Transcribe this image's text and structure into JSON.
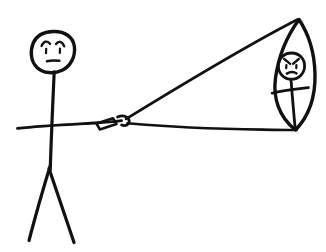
{
  "drawing": {
    "title": "Stick figure flying an angry kite",
    "medium": "black-ink-sketch",
    "background_color": "#ffffff",
    "ink_color": "#111111",
    "canvas": {
      "width": 326,
      "height": 252
    },
    "caption": "",
    "elements": [
      {
        "name": "stick-person",
        "label": "Stick person holding kite string",
        "mood": "sad",
        "parts": [
          {
            "name": "head",
            "shape": "ellipse",
            "cx": 53,
            "cy": 52,
            "rx": 21,
            "ry": 20
          },
          {
            "name": "left-eyebrow",
            "shape": "arc"
          },
          {
            "name": "right-eyebrow",
            "shape": "arc"
          },
          {
            "name": "left-eye",
            "shape": "tick"
          },
          {
            "name": "right-eye",
            "shape": "tick"
          },
          {
            "name": "mouth",
            "shape": "short-line",
            "expression": "flat-frown"
          },
          {
            "name": "torso",
            "shape": "line",
            "x1": 53,
            "y1": 72,
            "x2": 50,
            "y2": 170
          },
          {
            "name": "arms",
            "shape": "line",
            "x1": 18,
            "y1": 128,
            "x2": 120,
            "y2": 122
          },
          {
            "name": "left-leg",
            "shape": "line",
            "x1": 47,
            "y1": 168,
            "x2": 28,
            "y2": 240
          },
          {
            "name": "right-leg",
            "shape": "line",
            "x1": 47,
            "y1": 168,
            "x2": 73,
            "y2": 242
          }
        ]
      },
      {
        "name": "kite-handle",
        "label": "Kite string handle / reel in the hand",
        "parts": [
          {
            "name": "handle-body",
            "shape": "quad"
          },
          {
            "name": "handle-tip",
            "shape": "hook"
          }
        ]
      },
      {
        "name": "kite-string-upper",
        "label": "Upper kite string to kite apex",
        "shape": "line",
        "x1": 128,
        "y1": 120,
        "x2": 299,
        "y2": 20
      },
      {
        "name": "kite-string-lower",
        "label": "Lower kite string to kite tail point",
        "shape": "line",
        "x1": 128,
        "y1": 123,
        "x2": 297,
        "y2": 130
      },
      {
        "name": "kite",
        "label": "Leaf-shaped kite with an angry face",
        "mood": "angry",
        "parts": [
          {
            "name": "kite-outline",
            "shape": "leaf",
            "apex_x": 299,
            "apex_y": 20,
            "tail_x": 297,
            "tail_y": 130
          },
          {
            "name": "kite-face-head",
            "shape": "circle",
            "cx": 291,
            "cy": 66,
            "r": 13
          },
          {
            "name": "kite-left-eyebrow",
            "shape": "slant"
          },
          {
            "name": "kite-right-eyebrow",
            "shape": "slant"
          },
          {
            "name": "kite-left-eye",
            "shape": "dot"
          },
          {
            "name": "kite-right-eye",
            "shape": "dot"
          },
          {
            "name": "kite-mouth",
            "shape": "frown"
          },
          {
            "name": "kite-body-spine",
            "shape": "line",
            "x1": 291,
            "y1": 79,
            "x2": 295,
            "y2": 128
          },
          {
            "name": "kite-body-arms",
            "shape": "line",
            "x1": 272,
            "y1": 92,
            "x2": 308,
            "y2": 88
          }
        ]
      }
    ]
  }
}
